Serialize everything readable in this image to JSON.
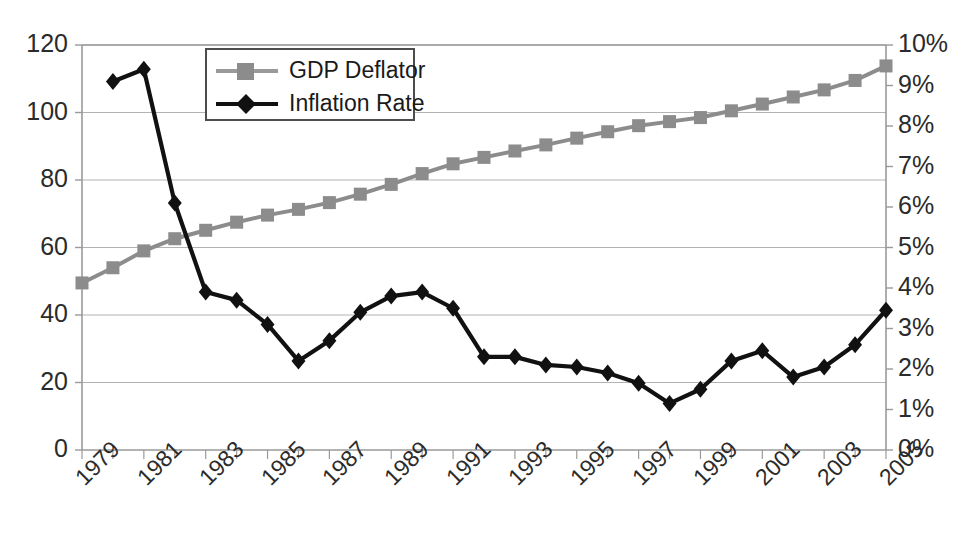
{
  "chart_data": {
    "type": "line",
    "title": "",
    "xlabel": "",
    "ylabel": "",
    "grid": true,
    "legend_position": "top-left-inside",
    "x": [
      1979,
      1980,
      1981,
      1982,
      1983,
      1984,
      1985,
      1986,
      1987,
      1988,
      1989,
      1990,
      1991,
      1992,
      1993,
      1994,
      1995,
      1996,
      1997,
      1998,
      1999,
      2000,
      2001,
      2002,
      2003,
      2004,
      2005
    ],
    "x_tick_labels": [
      "1979",
      "1981",
      "1983",
      "1985",
      "1987",
      "1989",
      "1991",
      "1993",
      "1995",
      "1997",
      "1999",
      "2001",
      "2003",
      "2005"
    ],
    "x_tick_values": [
      1979,
      1981,
      1983,
      1985,
      1987,
      1989,
      1991,
      1993,
      1995,
      1997,
      1999,
      2001,
      2003,
      2005
    ],
    "xlim": [
      1979,
      2005
    ],
    "axes": [
      {
        "id": "left",
        "name": "GDP Deflator index",
        "ylim": [
          0,
          120
        ],
        "ticks": [
          0,
          20,
          40,
          60,
          80,
          100,
          120
        ],
        "tick_labels": [
          "0",
          "20",
          "40",
          "60",
          "80",
          "100",
          "120"
        ]
      },
      {
        "id": "right",
        "name": "Inflation Rate",
        "ylim": [
          0,
          10
        ],
        "ticks": [
          0,
          1,
          2,
          3,
          4,
          5,
          6,
          7,
          8,
          9,
          10
        ],
        "tick_labels": [
          "0%",
          "1%",
          "2%",
          "3%",
          "4%",
          "5%",
          "6%",
          "7%",
          "8%",
          "9%",
          "10%"
        ]
      }
    ],
    "series": [
      {
        "name": "GDP Deflator",
        "axis": "left",
        "color": "#8c8c8c",
        "marker": "square",
        "x": [
          1979,
          1980,
          1981,
          1982,
          1983,
          1984,
          1985,
          1986,
          1987,
          1988,
          1989,
          1990,
          1991,
          1992,
          1993,
          1994,
          1995,
          1996,
          1997,
          1998,
          1999,
          2000,
          2001,
          2002,
          2003,
          2004,
          2005
        ],
        "values": [
          49.5,
          54.0,
          59.0,
          62.6,
          65.1,
          67.5,
          69.6,
          71.3,
          73.3,
          75.8,
          78.7,
          81.9,
          84.8,
          86.7,
          88.6,
          90.4,
          92.4,
          94.3,
          96.1,
          97.3,
          98.5,
          100.5,
          102.5,
          104.6,
          106.7,
          109.5,
          113.8
        ]
      },
      {
        "name": "Inflation Rate",
        "axis": "right",
        "color": "#111111",
        "marker": "diamond",
        "x": [
          1980,
          1981,
          1982,
          1983,
          1984,
          1985,
          1986,
          1987,
          1988,
          1989,
          1990,
          1991,
          1992,
          1993,
          1994,
          1995,
          1996,
          1997,
          1998,
          1999,
          2000,
          2001,
          2002,
          2003,
          2004,
          2005
        ],
        "values": [
          9.1,
          9.4,
          6.1,
          3.9,
          3.7,
          3.1,
          2.2,
          2.7,
          3.4,
          3.8,
          3.9,
          3.5,
          2.3,
          2.3,
          2.1,
          2.05,
          1.9,
          1.65,
          1.15,
          1.5,
          2.2,
          2.45,
          1.8,
          2.05,
          2.6,
          3.45
        ]
      }
    ]
  },
  "legend": {
    "items": [
      {
        "label": "GDP Deflator",
        "color": "#8c8c8c",
        "marker": "square"
      },
      {
        "label": "Inflation Rate",
        "color": "#111111",
        "marker": "diamond"
      }
    ]
  }
}
